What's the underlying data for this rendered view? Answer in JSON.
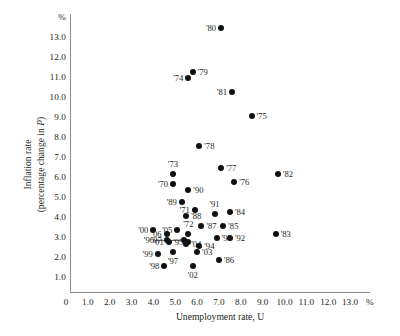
{
  "chart_data": {
    "type": "scatter",
    "title": "",
    "xlabel": "Unemployment rate, U",
    "ylabel": "Inflation rate (percentage change in P)",
    "x_unit_symbol": "%",
    "y_unit_symbol": "%",
    "xlim": [
      0,
      13.8
    ],
    "ylim": [
      0,
      13.9
    ],
    "grid": false,
    "legend": "none",
    "xticks": [
      "0",
      "1.0",
      "2.0",
      "3.0",
      "4.0",
      "5.0",
      "6.0",
      "7.0",
      "8.0",
      "9.0",
      "10.0",
      "11.0",
      "12.0",
      "13.0"
    ],
    "xtick_values": [
      0,
      1,
      2,
      3,
      4,
      5,
      6,
      7,
      8,
      9,
      10,
      11,
      12,
      13
    ],
    "yticks": [
      "1.0",
      "2.0",
      "3.0",
      "4.0",
      "5.0",
      "6.0",
      "7.0",
      "8.0",
      "9.0",
      "10.0",
      "11.0",
      "12.0",
      "13.0"
    ],
    "ytick_values": [
      1,
      2,
      3,
      4,
      5,
      6,
      7,
      8,
      9,
      10,
      11,
      12,
      13
    ],
    "point_color": "#111111",
    "axis_color": "#8a8a8a",
    "points": [
      {
        "label": "'80",
        "x": 7.1,
        "y": 13.5,
        "lpos": "left"
      },
      {
        "label": "'74",
        "x": 5.6,
        "y": 11.0,
        "lpos": "left"
      },
      {
        "label": "'79",
        "x": 5.8,
        "y": 11.3,
        "lpos": "right"
      },
      {
        "label": "'81",
        "x": 7.6,
        "y": 10.3,
        "lpos": "left"
      },
      {
        "label": "'75",
        "x": 8.5,
        "y": 9.1,
        "lpos": "right"
      },
      {
        "label": "'78",
        "x": 6.1,
        "y": 7.6,
        "lpos": "right"
      },
      {
        "label": "'73",
        "x": 4.9,
        "y": 6.2,
        "lpos": "top"
      },
      {
        "label": "'77",
        "x": 7.1,
        "y": 6.5,
        "lpos": "right"
      },
      {
        "label": "'82",
        "x": 9.7,
        "y": 6.2,
        "lpos": "right"
      },
      {
        "label": "'76",
        "x": 7.7,
        "y": 5.8,
        "lpos": "right"
      },
      {
        "label": "'71",
        "x": 5.9,
        "y": 4.4,
        "lpos": "left"
      },
      {
        "label": "'70",
        "x": 4.9,
        "y": 5.7,
        "lpos": "left"
      },
      {
        "label": "'90",
        "x": 5.6,
        "y": 5.4,
        "lpos": "right"
      },
      {
        "label": "'89",
        "x": 5.3,
        "y": 4.8,
        "lpos": "left"
      },
      {
        "label": "'91",
        "x": 6.8,
        "y": 4.2,
        "lpos": "top"
      },
      {
        "label": "'84",
        "x": 7.5,
        "y": 4.3,
        "lpos": "right"
      },
      {
        "label": "'05",
        "x": 5.1,
        "y": 3.4,
        "lpos": "left"
      },
      {
        "label": "'88",
        "x": 5.5,
        "y": 4.1,
        "lpos": "right"
      },
      {
        "label": "'87",
        "x": 6.2,
        "y": 3.6,
        "lpos": "right"
      },
      {
        "label": "'85",
        "x": 7.2,
        "y": 3.6,
        "lpos": "right"
      },
      {
        "label": "'00",
        "x": 4.0,
        "y": 3.4,
        "lpos": "left"
      },
      {
        "label": "'06",
        "x": 4.6,
        "y": 3.2,
        "lpos": "left"
      },
      {
        "label": "'72",
        "x": 5.6,
        "y": 3.2,
        "lpos": "top"
      },
      {
        "label": "'92",
        "x": 7.5,
        "y": 3.0,
        "lpos": "right"
      },
      {
        "label": "'96",
        "x": 5.4,
        "y": 2.9,
        "lpos": "leftline"
      },
      {
        "label": "'07",
        "x": 4.6,
        "y": 2.9,
        "lpos": "left"
      },
      {
        "label": "'04",
        "x": 5.5,
        "y": 2.7,
        "lpos": "right"
      },
      {
        "label": "'83",
        "x": 9.6,
        "y": 3.2,
        "lpos": "right"
      },
      {
        "label": "'93",
        "x": 6.9,
        "y": 3.0,
        "lpos": "right"
      },
      {
        "label": "'01",
        "x": 4.7,
        "y": 2.8,
        "lpos": "left"
      },
      {
        "label": "'95",
        "x": 5.6,
        "y": 2.8,
        "lpos": "left"
      },
      {
        "label": "'94",
        "x": 6.1,
        "y": 2.6,
        "lpos": "right"
      },
      {
        "label": "'99",
        "x": 4.2,
        "y": 2.2,
        "lpos": "left"
      },
      {
        "label": "'97",
        "x": 4.9,
        "y": 2.3,
        "lpos": "bottom"
      },
      {
        "label": "'03",
        "x": 6.0,
        "y": 2.3,
        "lpos": "right"
      },
      {
        "label": "'86",
        "x": 7.0,
        "y": 1.9,
        "lpos": "right"
      },
      {
        "label": "'98",
        "x": 4.5,
        "y": 1.6,
        "lpos": "left"
      },
      {
        "label": "'02",
        "x": 5.8,
        "y": 1.6,
        "lpos": "bottom"
      }
    ]
  }
}
